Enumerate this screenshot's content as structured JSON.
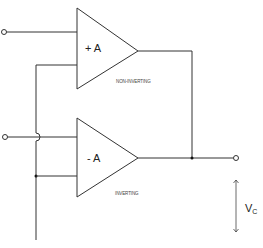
{
  "diagram": {
    "type": "circuit-schematic",
    "amplifiers": [
      {
        "id": "top",
        "gain_label": "+ A",
        "caption": "NON-INVERTING"
      },
      {
        "id": "bottom",
        "gain_label": "- A",
        "caption": "INVERTING"
      }
    ],
    "output": {
      "voltage_label": "V",
      "voltage_subscript": "C"
    }
  }
}
